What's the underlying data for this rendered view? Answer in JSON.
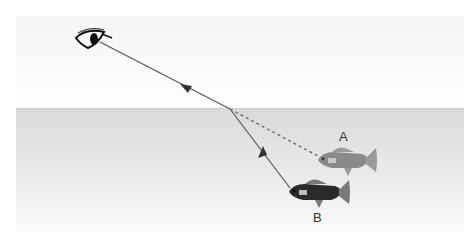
{
  "diagram": {
    "labels": {
      "fish_apparent": "A",
      "fish_actual": "B"
    },
    "elements": {
      "eye": "eye-icon",
      "fish_apparent": "fish-icon",
      "fish_actual": "fish-icon"
    },
    "colors": {
      "ray": "#555555",
      "dashed_ray": "#666666",
      "water_top": "#d9d9d9",
      "fish_apparent": "#8a8a8a",
      "fish_actual": "#2a2a2a"
    },
    "geometry": {
      "eye": [
        85,
        38
      ],
      "refraction_point": [
        230,
        109
      ],
      "fish_actual_nose": [
        290,
        190
      ],
      "fish_apparent_nose": [
        318,
        158
      ],
      "water_surface_y": 108
    }
  }
}
